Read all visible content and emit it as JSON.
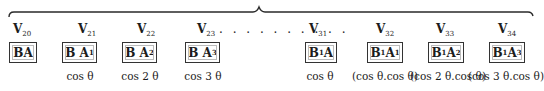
{
  "brace": {
    "span": "V20 to V34",
    "peak_position": "between V23 and V31"
  },
  "columns": [
    {
      "v_base": "V",
      "v_sub": "20",
      "box_base": "BA",
      "box_sub1": "",
      "box_mid": "",
      "box_sub2": "",
      "cos": ""
    },
    {
      "v_base": "V",
      "v_sub": "21",
      "box_base": "B A",
      "box_sub1": "",
      "box_mid": "",
      "box_sub2": "1",
      "cos": "cos θ"
    },
    {
      "v_base": "V",
      "v_sub": "22",
      "box_base": "B A",
      "box_sub1": "",
      "box_mid": "",
      "box_sub2": "2",
      "cos": "cos 2 θ"
    },
    {
      "v_base": "V",
      "v_sub": "23",
      "box_base": "B A",
      "box_sub1": "",
      "box_mid": "",
      "box_sub2": "3",
      "cos": "cos 3 θ"
    },
    {
      "v_base": "V",
      "v_sub": "31",
      "box_base": "B",
      "box_sub1": "1",
      "box_mid": " A",
      "box_sub2": "",
      "cos": "cos θ"
    },
    {
      "v_base": "V",
      "v_sub": "32",
      "box_base": "B",
      "box_sub1": "1",
      "box_mid": "A",
      "box_sub2": "1",
      "cos": "(cos θ.cos θ)"
    },
    {
      "v_base": "V",
      "v_sub": "33",
      "box_base": "B",
      "box_sub1": "1",
      "box_mid": "A",
      "box_sub2": "2",
      "cos": "(cos 2 θ.cos θ)"
    },
    {
      "v_base": "V",
      "v_sub": "34",
      "box_base": "B",
      "box_sub1": "1",
      "box_mid": "A",
      "box_sub2": "3",
      "cos": "(cos 3 θ.cos θ)"
    }
  ],
  "ellipsis": ". . . . . . . . . ."
}
